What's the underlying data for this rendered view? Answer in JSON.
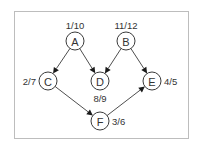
{
  "diagram": {
    "type": "directed-graph",
    "colors": {
      "frame": "#bdbdbd",
      "stroke": "#3a3a3a",
      "text": "#333333",
      "arrow": "#1a1a1a",
      "background": "#ffffff"
    },
    "frame": {
      "x": 14,
      "y": 11,
      "width": 174,
      "height": 127
    },
    "node_radius": 9,
    "nodes": [
      {
        "id": "A",
        "label": "A",
        "x": 75,
        "y": 41,
        "time": "1/10",
        "time_pos": "above"
      },
      {
        "id": "B",
        "label": "B",
        "x": 126,
        "y": 41,
        "time": "11/12",
        "time_pos": "above"
      },
      {
        "id": "C",
        "label": "C",
        "x": 48,
        "y": 81,
        "time": "2/7",
        "time_pos": "left"
      },
      {
        "id": "D",
        "label": "D",
        "x": 100,
        "y": 81,
        "time": "8/9",
        "time_pos": "below"
      },
      {
        "id": "E",
        "label": "E",
        "x": 152,
        "y": 81,
        "time": "4/5",
        "time_pos": "right"
      },
      {
        "id": "F",
        "label": "F",
        "x": 100,
        "y": 121,
        "time": "3/6",
        "time_pos": "right"
      }
    ],
    "edges": [
      {
        "from": "A",
        "to": "C"
      },
      {
        "from": "A",
        "to": "D"
      },
      {
        "from": "B",
        "to": "D"
      },
      {
        "from": "B",
        "to": "E"
      },
      {
        "from": "C",
        "to": "F"
      },
      {
        "from": "F",
        "to": "E"
      }
    ]
  }
}
